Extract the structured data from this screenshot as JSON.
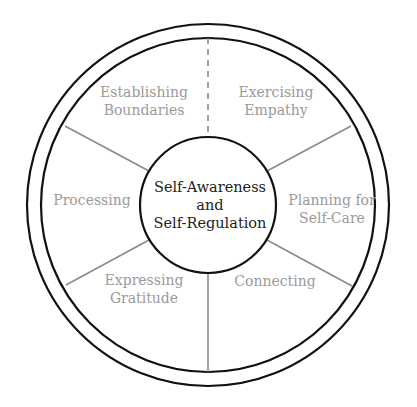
{
  "diagram": {
    "center": {
      "lines": [
        "Self-Awareness",
        "and",
        "Self-Regulation"
      ]
    },
    "segments": [
      {
        "id": "establishing-boundaries",
        "lines": [
          "Establishing",
          "Boundaries"
        ]
      },
      {
        "id": "exercising-empathy",
        "lines": [
          "Exercising",
          "Empathy"
        ]
      },
      {
        "id": "planning-for-self-care",
        "lines": [
          "Planning for",
          "Self-Care"
        ]
      },
      {
        "id": "connecting",
        "lines": [
          "Connecting"
        ]
      },
      {
        "id": "expressing-gratitude",
        "lines": [
          "Expressing",
          "Gratitude"
        ]
      },
      {
        "id": "processing",
        "lines": [
          "Processing"
        ]
      }
    ],
    "colors": {
      "ring_stroke": "#111111",
      "spoke_stroke": "#8a8a8a",
      "segment_text": "#9a9a9a",
      "center_text": "#222222"
    }
  }
}
